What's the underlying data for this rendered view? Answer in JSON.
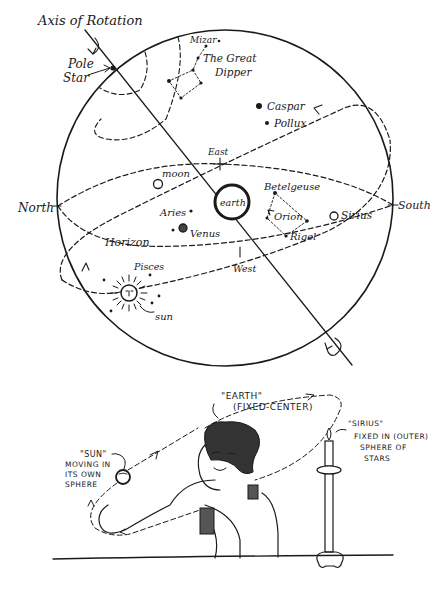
{
  "diagram": {
    "celestial_sphere": {
      "axis_label": "Axis of Rotation",
      "pole_star_label_1": "Pole",
      "pole_star_label_2": "Star",
      "mizar_label": "Mizar",
      "dipper_label_1": "The Great",
      "dipper_label_2": "Dipper",
      "caspar_label": "Caspar",
      "pollux_label": "Pollux",
      "east_label": "East",
      "west_label": "West",
      "north_label": "North",
      "south_label": "South",
      "moon_label": "moon",
      "earth_label": "earth",
      "betelgeuse_label": "Betelgeuse",
      "orion_label": "Orion",
      "rigel_label": "Rigel",
      "sirius_label": "Sirius",
      "aries_label": "Aries",
      "venus_label": "Venus",
      "horizon_label": "Horizon",
      "pisces_label": "Pisces",
      "sun_label": "sun"
    },
    "analogy_scene": {
      "earth_label_1": "\"EARTH\"",
      "earth_label_2": "(FIXED-CENTER)",
      "sun_label_1": "\"SUN\"",
      "sun_label_2": "MOVING IN",
      "sun_label_3": "ITS OWN",
      "sun_label_4": "SPHERE",
      "sirius_label_1": "\"SIRIUS\"",
      "sirius_label_2": "FIXED IN (OUTER)",
      "sirius_label_3": "SPHERE OF",
      "sirius_label_4": "STARS"
    }
  }
}
